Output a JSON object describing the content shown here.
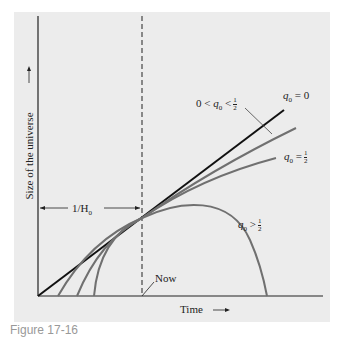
{
  "figure": {
    "caption": "Figure 17-16",
    "x_axis_label": "Time",
    "y_axis_label": "Size of the universe",
    "interval_label": "1/H",
    "interval_sub": "0",
    "now_label": "Now",
    "curves": [
      {
        "name": "q0 = 0",
        "label_var": "q",
        "label_sub": "0",
        "label_rel": "= 0"
      },
      {
        "name": "0 < q0 < 1/2",
        "label_pre": "0 <",
        "label_var": "q",
        "label_sub": "0",
        "label_rel": "<",
        "frac_num": "1",
        "frac_den": "2"
      },
      {
        "name": "q0 = 1/2",
        "label_var": "q",
        "label_sub": "0",
        "label_rel": "=",
        "frac_num": "1",
        "frac_den": "2"
      },
      {
        "name": "q0 > 1/2",
        "label_var": "q",
        "label_sub": "0",
        "label_rel": ">",
        "frac_num": "1",
        "frac_den": "2"
      }
    ]
  }
}
